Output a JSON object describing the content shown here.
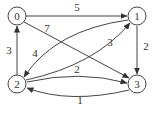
{
  "diagram": {
    "type": "directed-weighted-graph",
    "nodes": [
      {
        "id": "0",
        "label": "0",
        "x": 17,
        "y": 16
      },
      {
        "id": "1",
        "label": "1",
        "x": 137,
        "y": 16
      },
      {
        "id": "2",
        "label": "2",
        "x": 17,
        "y": 84
      },
      {
        "id": "3",
        "label": "3",
        "x": 137,
        "y": 84
      }
    ],
    "edges": [
      {
        "from": "0",
        "to": "1",
        "weight": "5",
        "label_x": 77,
        "label_y": 11
      },
      {
        "from": "0",
        "to": "3",
        "weight": "7",
        "label_x": 47,
        "label_y": 32
      },
      {
        "from": "2",
        "to": "0",
        "weight": "3",
        "label_x": 9,
        "label_y": 54
      },
      {
        "from": "1",
        "to": "2",
        "weight": "4",
        "label_x": 35,
        "label_y": 57
      },
      {
        "from": "2",
        "to": "1",
        "weight": "3",
        "label_x": 110,
        "label_y": 46
      },
      {
        "from": "1",
        "to": "3",
        "weight": "2",
        "label_x": 146,
        "label_y": 50
      },
      {
        "from": "2",
        "to": "3",
        "weight": "2",
        "label_x": 77,
        "label_y": 73
      },
      {
        "from": "3",
        "to": "2",
        "weight": "1",
        "label_x": 80,
        "label_y": 104
      }
    ]
  }
}
